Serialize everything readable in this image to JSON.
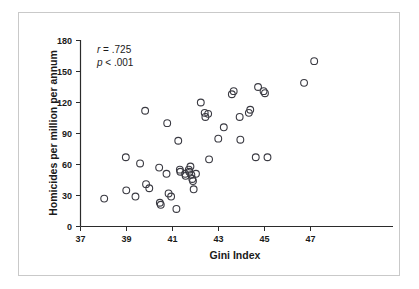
{
  "figure": {
    "frame_color": "#c9c9c9",
    "background": "#ffffff",
    "marker_color": "#3a3a42",
    "axis_color": "#2b2b2b"
  },
  "annotations": {
    "correlation": "r = .725",
    "correlation_r_symbol": "r",
    "correlation_value": " = .725",
    "pvalue_symbol": "p",
    "pvalue_rest": " < .001",
    "pvalue": "p < .001"
  },
  "chart_data": {
    "type": "scatter",
    "title": "",
    "subtitle": "",
    "xlabel": "Gini Index",
    "ylabel": "Homicides per million per annum",
    "xlim": [
      37,
      48
    ],
    "ylim": [
      0,
      180
    ],
    "xticks": [
      37,
      39,
      41,
      43,
      45,
      47
    ],
    "yticks": [
      0,
      30,
      60,
      90,
      120,
      150,
      180
    ],
    "xtick_labels": [
      "37",
      "39",
      "41",
      "43",
      "45",
      "47"
    ],
    "ytick_labels": [
      "0",
      "30",
      "60",
      "90",
      "120",
      "150",
      "180"
    ],
    "grid": false,
    "legend": null,
    "marker": "open-circle",
    "n_points": 58,
    "annotations": [
      "r = .725",
      "p < .001"
    ],
    "points": [
      {
        "x": 38.03,
        "y": 27
      },
      {
        "x": 38.97,
        "y": 67
      },
      {
        "x": 38.99,
        "y": 35
      },
      {
        "x": 39.39,
        "y": 29
      },
      {
        "x": 39.59,
        "y": 61
      },
      {
        "x": 39.81,
        "y": 112
      },
      {
        "x": 39.85,
        "y": 41
      },
      {
        "x": 39.99,
        "y": 37
      },
      {
        "x": 40.42,
        "y": 57
      },
      {
        "x": 40.45,
        "y": 23
      },
      {
        "x": 40.49,
        "y": 21
      },
      {
        "x": 40.74,
        "y": 51
      },
      {
        "x": 40.77,
        "y": 100
      },
      {
        "x": 40.83,
        "y": 32
      },
      {
        "x": 40.94,
        "y": 29
      },
      {
        "x": 41.17,
        "y": 17
      },
      {
        "x": 41.25,
        "y": 83
      },
      {
        "x": 41.32,
        "y": 55
      },
      {
        "x": 41.34,
        "y": 53
      },
      {
        "x": 41.55,
        "y": 51
      },
      {
        "x": 41.57,
        "y": 49
      },
      {
        "x": 41.71,
        "y": 55
      },
      {
        "x": 41.73,
        "y": 53
      },
      {
        "x": 41.78,
        "y": 58
      },
      {
        "x": 41.82,
        "y": 50
      },
      {
        "x": 41.86,
        "y": 46
      },
      {
        "x": 41.89,
        "y": 44
      },
      {
        "x": 41.92,
        "y": 36
      },
      {
        "x": 42.02,
        "y": 51
      },
      {
        "x": 42.23,
        "y": 120
      },
      {
        "x": 42.4,
        "y": 110
      },
      {
        "x": 42.43,
        "y": 106
      },
      {
        "x": 42.55,
        "y": 109
      },
      {
        "x": 42.59,
        "y": 65
      },
      {
        "x": 42.99,
        "y": 85
      },
      {
        "x": 43.23,
        "y": 96
      },
      {
        "x": 43.58,
        "y": 128
      },
      {
        "x": 43.66,
        "y": 131
      },
      {
        "x": 43.92,
        "y": 106
      },
      {
        "x": 43.95,
        "y": 84
      },
      {
        "x": 44.32,
        "y": 110
      },
      {
        "x": 44.38,
        "y": 113
      },
      {
        "x": 44.62,
        "y": 67
      },
      {
        "x": 44.72,
        "y": 135
      },
      {
        "x": 44.96,
        "y": 131
      },
      {
        "x": 45.02,
        "y": 129
      },
      {
        "x": 45.13,
        "y": 67
      },
      {
        "x": 46.72,
        "y": 139
      },
      {
        "x": 47.16,
        "y": 160
      }
    ]
  }
}
